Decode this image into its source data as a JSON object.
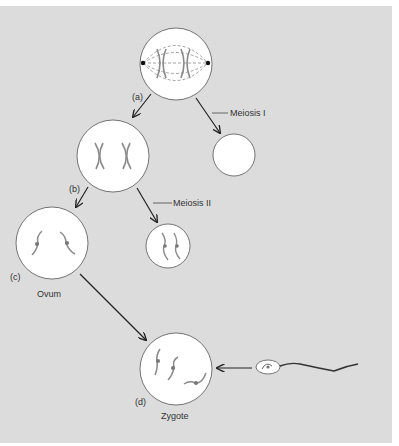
{
  "diagram": {
    "background_color": "#dcdcdc",
    "cell_fill": "#ffffff",
    "chromosome_color": "#8a8a8a",
    "labels": {
      "a": "(a)",
      "b": "(b)",
      "c": "(c)",
      "d": "(d)",
      "meiosis_1": "Meiosis I",
      "meiosis_2": "Meiosis II",
      "ovum": "Ovum",
      "zygote": "Zygote"
    },
    "nodes": [
      {
        "id": "a",
        "name": "primary-oocyte-spindle",
        "cx": 176,
        "cy": 64,
        "r": 36
      },
      {
        "id": "b",
        "name": "secondary-oocyte",
        "cx": 113,
        "cy": 156,
        "r": 36
      },
      {
        "id": "pb1",
        "name": "first-polar-body",
        "cx": 234,
        "cy": 155,
        "r": 21
      },
      {
        "id": "c",
        "name": "ovum",
        "cx": 52,
        "cy": 243,
        "r": 36
      },
      {
        "id": "pb2",
        "name": "second-polar-body",
        "cx": 168,
        "cy": 246,
        "r": 22
      },
      {
        "id": "d",
        "name": "zygote",
        "cx": 176,
        "cy": 369,
        "r": 36
      },
      {
        "id": "sperm",
        "name": "sperm",
        "cx": 268,
        "cy": 367
      }
    ],
    "edges": [
      {
        "from": "a",
        "to": "b"
      },
      {
        "from": "a",
        "to": "pb1",
        "label": "Meiosis I"
      },
      {
        "from": "b",
        "to": "c"
      },
      {
        "from": "b",
        "to": "pb2",
        "label": "Meiosis II"
      },
      {
        "from": "c",
        "to": "d"
      },
      {
        "from": "sperm",
        "to": "d"
      }
    ]
  }
}
